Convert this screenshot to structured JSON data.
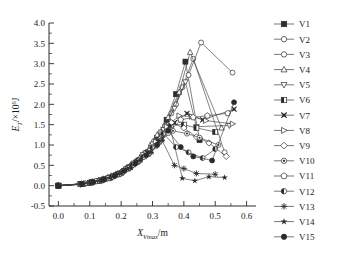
{
  "chart_data": {
    "type": "line",
    "title": "",
    "xlabel": "X_Vmax /m",
    "ylabel": "E_T /×10⁶ J",
    "xlabel_parts": {
      "main": "X",
      "sub": "Vmax",
      "unit": "/m"
    },
    "ylabel_parts": {
      "main": "E",
      "sub": "T",
      "unit": "/×10",
      "sup": "6",
      "unit2": "J"
    },
    "xlim": [
      -0.03,
      0.63
    ],
    "ylim": [
      -0.5,
      4.0
    ],
    "xticks": [
      0.0,
      0.1,
      0.2,
      0.3,
      0.4,
      0.5,
      0.6
    ],
    "xticklabels": [
      "0.0",
      "0.1",
      "0.2",
      "0.3",
      "0.4",
      "0.5",
      "0.6"
    ],
    "yticks": [
      -0.5,
      0.0,
      0.5,
      1.0,
      1.5,
      2.0,
      2.5,
      3.0,
      3.5,
      4.0
    ],
    "yticklabels": [
      "-0.5",
      "0.0",
      "0.5",
      "1.0",
      "1.5",
      "2.0",
      "2.5",
      "3.0",
      "3.5",
      "4.0"
    ],
    "x_minor_per_interval": 2,
    "y_minor_per_interval": 2,
    "grid": false,
    "legend_position": "right",
    "frame": "left-bottom",
    "line_color": "#404040",
    "series": [
      {
        "name": "V1",
        "marker": "filled-square",
        "x": [
          0.0,
          0.075,
          0.105,
          0.135,
          0.165,
          0.195,
          0.225,
          0.255,
          0.285,
          0.315,
          0.345,
          0.375,
          0.405,
          0.45
        ],
        "y": [
          0.0,
          0.04,
          0.08,
          0.13,
          0.2,
          0.3,
          0.45,
          0.62,
          0.82,
          1.18,
          1.62,
          2.25,
          3.05,
          1.12
        ]
      },
      {
        "name": "V2",
        "marker": "open-circle",
        "x": [
          0.0,
          0.08,
          0.11,
          0.145,
          0.175,
          0.205,
          0.235,
          0.265,
          0.295,
          0.325,
          0.36,
          0.395,
          0.43,
          0.53
        ],
        "y": [
          0.0,
          0.05,
          0.09,
          0.15,
          0.24,
          0.36,
          0.52,
          0.72,
          0.98,
          1.32,
          1.78,
          2.42,
          3.12,
          0.82
        ]
      },
      {
        "name": "V3",
        "marker": "open-circle",
        "x": [
          0.0,
          0.085,
          0.115,
          0.15,
          0.18,
          0.21,
          0.245,
          0.275,
          0.305,
          0.34,
          0.375,
          0.415,
          0.455,
          0.555
        ],
        "y": [
          0.0,
          0.05,
          0.1,
          0.17,
          0.26,
          0.38,
          0.58,
          0.8,
          1.1,
          1.48,
          2.0,
          2.72,
          3.52,
          2.78
        ]
      },
      {
        "name": "V4",
        "marker": "open-triangle-up",
        "x": [
          0.0,
          0.075,
          0.105,
          0.14,
          0.17,
          0.2,
          0.23,
          0.26,
          0.29,
          0.315,
          0.35,
          0.385,
          0.42,
          0.52
        ],
        "y": [
          0.0,
          0.04,
          0.09,
          0.14,
          0.22,
          0.33,
          0.5,
          0.68,
          0.92,
          1.25,
          1.68,
          2.3,
          3.28,
          1.42
        ]
      },
      {
        "name": "V5",
        "marker": "open-triangle-down",
        "x": [
          0.0,
          0.08,
          0.11,
          0.145,
          0.175,
          0.21,
          0.24,
          0.27,
          0.3,
          0.335,
          0.37,
          0.405,
          0.44,
          0.545
        ],
        "y": [
          0.0,
          0.05,
          0.1,
          0.16,
          0.25,
          0.37,
          0.55,
          0.76,
          1.02,
          1.38,
          1.9,
          2.55,
          1.45,
          1.48
        ]
      },
      {
        "name": "V6",
        "marker": "half-square",
        "x": [
          0.0,
          0.07,
          0.1,
          0.13,
          0.16,
          0.19,
          0.22,
          0.25,
          0.285,
          0.32,
          0.36,
          0.4,
          0.44,
          0.5
        ],
        "y": [
          0.0,
          0.04,
          0.07,
          0.12,
          0.18,
          0.28,
          0.42,
          0.58,
          0.78,
          1.08,
          1.5,
          1.5,
          1.42,
          1.32
        ]
      },
      {
        "name": "V7",
        "marker": "x-cross",
        "x": [
          0.0,
          0.075,
          0.105,
          0.135,
          0.165,
          0.2,
          0.23,
          0.26,
          0.295,
          0.33,
          0.37,
          0.41,
          0.46,
          0.56
        ],
        "y": [
          0.0,
          0.04,
          0.08,
          0.13,
          0.21,
          0.31,
          0.46,
          0.64,
          0.85,
          1.15,
          1.55,
          1.78,
          1.62,
          1.88
        ]
      },
      {
        "name": "V8",
        "marker": "right-triangle",
        "x": [
          0.0,
          0.08,
          0.115,
          0.15,
          0.185,
          0.215,
          0.25,
          0.28,
          0.31,
          0.345,
          0.385,
          0.425,
          0.47,
          0.555
        ],
        "y": [
          0.0,
          0.05,
          0.1,
          0.17,
          0.26,
          0.4,
          0.58,
          0.8,
          1.08,
          1.45,
          1.72,
          1.7,
          1.6,
          1.52
        ]
      },
      {
        "name": "V9",
        "marker": "open-diamond",
        "x": [
          0.0,
          0.085,
          0.12,
          0.155,
          0.19,
          0.22,
          0.255,
          0.29,
          0.325,
          0.36,
          0.4,
          0.44,
          0.48,
          0.535
        ],
        "y": [
          0.0,
          0.05,
          0.11,
          0.18,
          0.28,
          0.42,
          0.62,
          0.85,
          1.15,
          1.55,
          1.42,
          1.2,
          1.05,
          0.72
        ]
      },
      {
        "name": "V10",
        "marker": "dot-circle",
        "x": [
          0.0,
          0.07,
          0.1,
          0.13,
          0.16,
          0.195,
          0.225,
          0.255,
          0.29,
          0.325,
          0.365,
          0.41,
          0.45,
          0.51
        ],
        "y": [
          0.0,
          0.03,
          0.07,
          0.12,
          0.19,
          0.29,
          0.44,
          0.6,
          0.8,
          1.1,
          1.35,
          1.28,
          1.18,
          1.0
        ]
      },
      {
        "name": "V11",
        "marker": "pentagon",
        "x": [
          0.0,
          0.08,
          0.11,
          0.14,
          0.175,
          0.205,
          0.24,
          0.275,
          0.31,
          0.35,
          0.39,
          0.43,
          0.475,
          0.54
        ],
        "y": [
          0.0,
          0.04,
          0.09,
          0.15,
          0.23,
          0.35,
          0.52,
          0.72,
          0.98,
          1.3,
          1.62,
          1.68,
          1.72,
          1.78
        ]
      },
      {
        "name": "V12",
        "marker": "half-circle",
        "x": [
          0.0,
          0.075,
          0.105,
          0.14,
          0.17,
          0.205,
          0.235,
          0.27,
          0.3,
          0.335,
          0.375,
          0.415,
          0.46,
          0.5
        ],
        "y": [
          0.0,
          0.04,
          0.08,
          0.14,
          0.22,
          0.33,
          0.5,
          0.7,
          0.94,
          1.28,
          0.95,
          0.82,
          0.68,
          0.9
        ]
      },
      {
        "name": "V13",
        "marker": "plus-star",
        "x": [
          0.0,
          0.07,
          0.1,
          0.13,
          0.165,
          0.195,
          0.23,
          0.26,
          0.295,
          0.33,
          0.37,
          0.4,
          0.44,
          0.5
        ],
        "y": [
          0.0,
          0.03,
          0.07,
          0.12,
          0.2,
          0.3,
          0.44,
          0.62,
          0.82,
          1.12,
          0.5,
          0.42,
          0.3,
          0.28
        ]
      },
      {
        "name": "V14",
        "marker": "star",
        "x": [
          0.0,
          0.08,
          0.115,
          0.15,
          0.185,
          0.22,
          0.25,
          0.285,
          0.32,
          0.355,
          0.395,
          0.435,
          0.48,
          0.53
        ],
        "y": [
          0.0,
          0.05,
          0.1,
          0.17,
          0.27,
          0.41,
          0.6,
          0.82,
          1.1,
          1.48,
          0.18,
          0.12,
          0.22,
          0.2
        ]
      },
      {
        "name": "V15",
        "marker": "filled-circle",
        "x": [
          0.0,
          0.075,
          0.11,
          0.145,
          0.18,
          0.21,
          0.245,
          0.28,
          0.315,
          0.35,
          0.39,
          0.43,
          0.49,
          0.56
        ],
        "y": [
          0.0,
          0.04,
          0.09,
          0.15,
          0.24,
          0.36,
          0.54,
          0.75,
          1.0,
          1.35,
          0.95,
          0.72,
          0.62,
          2.05
        ]
      }
    ]
  },
  "legend": {
    "items": [
      {
        "label": "V1",
        "marker": "filled-square"
      },
      {
        "label": "V2",
        "marker": "open-circle"
      },
      {
        "label": "V3",
        "marker": "open-circle"
      },
      {
        "label": "V4",
        "marker": "open-triangle-up"
      },
      {
        "label": "V5",
        "marker": "open-triangle-down"
      },
      {
        "label": "V6",
        "marker": "half-square"
      },
      {
        "label": "V7",
        "marker": "x-cross"
      },
      {
        "label": "V8",
        "marker": "right-triangle"
      },
      {
        "label": "V9",
        "marker": "open-diamond"
      },
      {
        "label": "V10",
        "marker": "dot-circle"
      },
      {
        "label": "V11",
        "marker": "pentagon"
      },
      {
        "label": "V12",
        "marker": "half-circle"
      },
      {
        "label": "V13",
        "marker": "plus-star"
      },
      {
        "label": "V14",
        "marker": "star"
      },
      {
        "label": "V15",
        "marker": "filled-circle"
      }
    ]
  }
}
